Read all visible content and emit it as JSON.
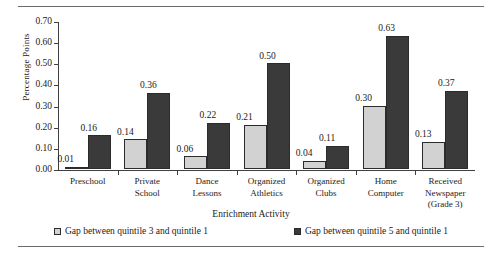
{
  "chart_data": {
    "type": "bar",
    "title": "",
    "xlabel": "Enrichment Activity",
    "ylabel": "Percentage Points",
    "ylim": [
      0.0,
      0.7
    ],
    "yticks": [
      "0.00",
      "0.10",
      "0.20",
      "0.30",
      "0.40",
      "0.50",
      "0.60",
      "0.70"
    ],
    "ytick_values": [
      0.0,
      0.1,
      0.2,
      0.3,
      0.4,
      0.5,
      0.6,
      0.7
    ],
    "grid": false,
    "legend_position": "bottom",
    "categories": [
      "Preschool",
      "Private School",
      "Dance Lessons",
      "Organized Athletics",
      "Organized Clubs",
      "Home Computer",
      "Received Newspaper (Grade 3)"
    ],
    "category_lines": [
      [
        "Preschool"
      ],
      [
        "Private",
        "School"
      ],
      [
        "Dance",
        "Lessons"
      ],
      [
        "Organized",
        "Athletics"
      ],
      [
        "Organized",
        "Clubs"
      ],
      [
        "Home",
        "Computer"
      ],
      [
        "Received",
        "Newspaper",
        "(Grade 3)"
      ]
    ],
    "series": [
      {
        "name": "Gap between quintile 3 and quintile 1",
        "color": "#d2d2d2",
        "values": [
          0.01,
          0.14,
          0.06,
          0.21,
          0.04,
          0.3,
          0.13
        ],
        "labels": [
          "0.01",
          "0.14",
          "0.06",
          "0.21",
          "0.04",
          "0.30",
          "0.13"
        ]
      },
      {
        "name": "Gap between quintile 5 and quintile 1",
        "color": "#3a3a3a",
        "values": [
          0.16,
          0.36,
          0.22,
          0.5,
          0.11,
          0.63,
          0.37
        ],
        "labels": [
          "0.16",
          "0.36",
          "0.22",
          "0.50",
          "0.11",
          "0.63",
          "0.37"
        ]
      }
    ]
  }
}
